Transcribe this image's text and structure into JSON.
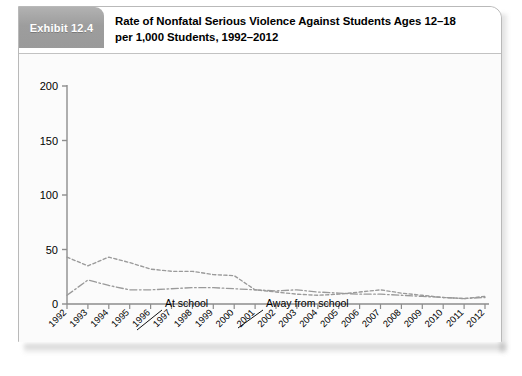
{
  "exhibit": {
    "tab_label": "Exhibit 12.4",
    "title_line1": "Rate of Nonfatal Serious Violence Against Students Ages 12–18",
    "title_line2": "per 1,000 Students, 1992–2012"
  },
  "colors": {
    "tab_background": "#9d9d9d",
    "tab_text": "#ffffff",
    "card_border": "#b9b9b9",
    "plot_background": "#fbfbfb",
    "axis": "#8d8d8d",
    "series_at_school": "#9a9a9a",
    "series_away_from_school": "#9a9a9a",
    "text": "#000000"
  },
  "chart_data": {
    "type": "line",
    "title": "Rate of Nonfatal Serious Violence Against Students Ages 12–18 per 1,000 Students, 1992–2012",
    "xlabel": "Year",
    "ylabel": "",
    "xlim": [
      1992,
      2012
    ],
    "ylim": [
      0,
      200
    ],
    "yticks": [
      0,
      50,
      100,
      150,
      200
    ],
    "ytick_labels": [
      "0",
      "50",
      "100",
      "150",
      "200"
    ],
    "grid": false,
    "legend_position": "inline-annotations",
    "categories": [
      "1992",
      "1993",
      "1994",
      "1995",
      "1996",
      "1997",
      "1998",
      "1999",
      "2000",
      "2001",
      "2002",
      "2003",
      "2004",
      "2005",
      "2006",
      "2007",
      "2008",
      "2009",
      "2010",
      "2011",
      "2012"
    ],
    "series": [
      {
        "name": "At school",
        "line_style": "dotted",
        "values": [
          43,
          35,
          43,
          38,
          32,
          30,
          30,
          27,
          26,
          13,
          11,
          9,
          8,
          9,
          11,
          13,
          10,
          8,
          6,
          5,
          7
        ]
      },
      {
        "name": "Away from school",
        "line_style": "dash-dot",
        "values": [
          8,
          22,
          17,
          13,
          13,
          14,
          15,
          15,
          14,
          13,
          12,
          13,
          11,
          10,
          9,
          9,
          8,
          7,
          6,
          5,
          6
        ]
      }
    ],
    "annotations": [
      {
        "text": "At school",
        "x": 1997,
        "y": 44
      },
      {
        "text": "Away from school",
        "x": 2002,
        "y": 44
      }
    ]
  }
}
